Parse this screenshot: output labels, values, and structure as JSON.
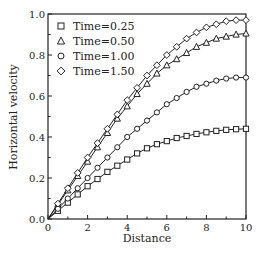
{
  "chart_data": {
    "type": "line",
    "title": "",
    "xlabel": "Distance",
    "ylabel": "Horizontal velocity",
    "xlim": [
      0,
      10
    ],
    "ylim": [
      0,
      1.0
    ],
    "xticks": [
      "0",
      "2",
      "4",
      "6",
      "8",
      "10"
    ],
    "yticks": [
      "0.0",
      "0.2",
      "0.4",
      "0.6",
      "0.8",
      "1.0"
    ],
    "grid": false,
    "legend_position": "upper-left",
    "x": [
      0,
      0.5,
      1,
      1.5,
      2,
      2.5,
      3,
      3.5,
      4,
      4.5,
      5,
      5.5,
      6,
      6.5,
      7,
      7.5,
      8,
      8.5,
      9,
      9.5,
      10
    ],
    "series": [
      {
        "name": "Time=0.25",
        "marker": "square",
        "values": [
          0,
          0.04,
          0.08,
          0.12,
          0.16,
          0.195,
          0.23,
          0.26,
          0.29,
          0.32,
          0.345,
          0.365,
          0.38,
          0.395,
          0.405,
          0.415,
          0.423,
          0.43,
          0.435,
          0.438,
          0.44
        ]
      },
      {
        "name": "Time=0.50",
        "marker": "triangle",
        "values": [
          0,
          0.07,
          0.14,
          0.21,
          0.28,
          0.35,
          0.42,
          0.49,
          0.55,
          0.61,
          0.66,
          0.71,
          0.75,
          0.78,
          0.81,
          0.84,
          0.86,
          0.88,
          0.89,
          0.9,
          0.905
        ]
      },
      {
        "name": "Time=1.00",
        "marker": "circle",
        "values": [
          0,
          0.05,
          0.1,
          0.15,
          0.2,
          0.25,
          0.3,
          0.35,
          0.4,
          0.44,
          0.48,
          0.52,
          0.56,
          0.59,
          0.62,
          0.645,
          0.66,
          0.675,
          0.685,
          0.69,
          0.69
        ]
      },
      {
        "name": "Time=1.50",
        "marker": "diamond",
        "values": [
          0,
          0.075,
          0.15,
          0.225,
          0.3,
          0.37,
          0.44,
          0.51,
          0.58,
          0.64,
          0.7,
          0.75,
          0.8,
          0.84,
          0.88,
          0.91,
          0.935,
          0.95,
          0.965,
          0.97,
          0.97
        ]
      }
    ]
  }
}
